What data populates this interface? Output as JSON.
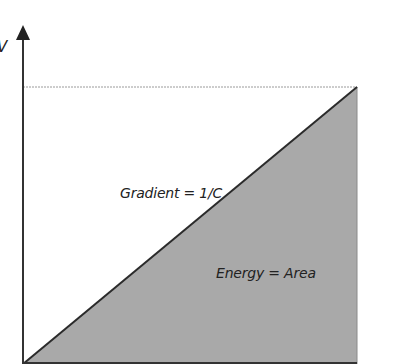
{
  "diagram": {
    "axis_label_y": "V",
    "gradient_label": "Gradient = 1/C",
    "area_label": "Energy = Area",
    "colors": {
      "fill": "#a9a9a9",
      "line": "#2b2b2b",
      "dashed": "#9a9a9a",
      "background": "#ffffff"
    }
  }
}
